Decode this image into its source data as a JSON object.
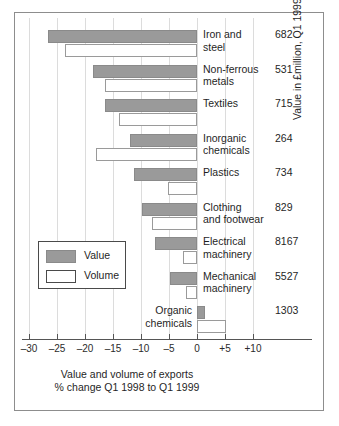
{
  "chart_data": {
    "type": "bar",
    "orientation": "horizontal",
    "title": "",
    "xlabel": "Value and volume of exports",
    "xlabel_line2": "% change Q1 1998 to Q1 1999",
    "ylabel_right": "Value in £million, Q1 1999",
    "xlim": [
      -32,
      12
    ],
    "xticks": [
      -30,
      -25,
      -20,
      -15,
      -10,
      -5,
      0,
      5,
      10
    ],
    "xticklabels": [
      "–30",
      "–25",
      "–20",
      "–15",
      "–10",
      "–5",
      "0",
      "+5",
      "+10"
    ],
    "grid": "vertical",
    "legend": {
      "position": "inside-lower-left",
      "entries": [
        {
          "label": "Value",
          "color": "#9a9a9a",
          "style": "filled"
        },
        {
          "label": "Volume",
          "color": "#ffffff",
          "style": "outline"
        }
      ]
    },
    "categories": [
      "Iron and steel",
      "Non-ferrous metals",
      "Textiles",
      "Inorganic chemicals",
      "Plastics",
      "Clothing and footwear",
      "Electrical machinery",
      "Mechanical machinery",
      "Organic chemicals"
    ],
    "series": [
      {
        "name": "Value",
        "values": [
          -26.6,
          -18.6,
          -16.4,
          -12.0,
          -11.3,
          -9.8,
          -7.5,
          -4.8,
          1.5
        ]
      },
      {
        "name": "Volume",
        "values": [
          -23.6,
          -16.4,
          -13.9,
          -18.0,
          -5.2,
          -8.0,
          -2.5,
          -2.0,
          5.2
        ]
      }
    ],
    "right_column_header": "Value in £million, Q1 1999",
    "right_column_values": [
      "682",
      "531",
      "715",
      "264",
      "734",
      "829",
      "8167",
      "5527",
      "1303"
    ]
  },
  "rows": [
    {
      "label_line1": "Iron and",
      "label_line2": "steel",
      "amount": "682"
    },
    {
      "label_line1": "Non-ferrous",
      "label_line2": "metals",
      "amount": "531"
    },
    {
      "label_line1": "Textiles",
      "label_line2": "",
      "amount": "715"
    },
    {
      "label_line1": "Inorganic",
      "label_line2": "chemicals",
      "amount": "264"
    },
    {
      "label_line1": "Plastics",
      "label_line2": "",
      "amount": "734"
    },
    {
      "label_line1": "Clothing",
      "label_line2": "and footwear",
      "amount": "829"
    },
    {
      "label_line1": "Electrical",
      "label_line2": "machinery",
      "amount": "8167"
    },
    {
      "label_line1": "Mechanical",
      "label_line2": "machinery",
      "amount": "5527"
    },
    {
      "label_line1": "Organic",
      "label_line2": "chemicals",
      "amount": "1303"
    }
  ],
  "axis": {
    "tick_labels": [
      "–30",
      "–25",
      "–20",
      "–15",
      "–10",
      "–5",
      "0",
      "+5",
      "+10"
    ],
    "caption_line1": "Value and volume of exports",
    "caption_line2": "% change Q1 1998 to Q1 1999",
    "right_label": "Value in £million, Q1 1999"
  },
  "legend": {
    "value_label": "Value",
    "volume_label": "Volume"
  }
}
